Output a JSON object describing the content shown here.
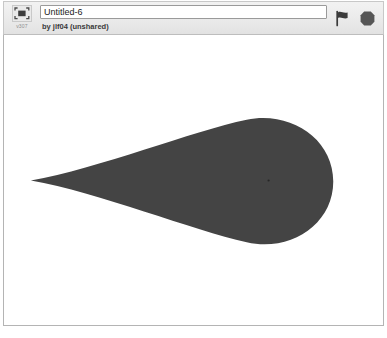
{
  "header": {
    "badge": {
      "icon": "project-thumbnail-icon",
      "version_label": "v307"
    },
    "title_value": "Untitled-6",
    "title_placeholder": "Project title",
    "byline": "by jlf04 (unshared)",
    "controls": [
      {
        "name": "green-flag-button",
        "icon": "flag-icon",
        "label": "Go"
      },
      {
        "name": "stop-button",
        "icon": "octagon-icon",
        "label": "Stop"
      }
    ]
  },
  "stage": {
    "background_color": "#ffffff",
    "sprite": {
      "name": "teardrop-sprite",
      "fill_color": "#444444",
      "outline": "none",
      "rotation_center": {
        "x": 269,
        "y": 181
      },
      "description": "dark gray teardrop shape, point toward left, rounded bulb at right"
    }
  },
  "colors": {
    "header_background": "#ececec",
    "header_border": "#c8c8c8",
    "stage_border": "#b4b4b4",
    "sprite": "#444444",
    "title_text": "#1b1b1b",
    "byline_text": "#3a3a3a",
    "version_text": "#8e8e8e"
  }
}
